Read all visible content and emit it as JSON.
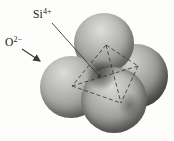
{
  "labels": {
    "si": {
      "base": "Si",
      "charge": "4+"
    },
    "o": {
      "base": "O",
      "charge": "2−"
    }
  },
  "colors": {
    "background": "#fdfdfc",
    "sphere_base": "#aaaaa8",
    "sphere_highlight": "#dededc",
    "sphere_rim_shadow": "#565654",
    "dashed_line": "#2f2f2f",
    "arrow": "#3a3a3a",
    "label_text": "#1a1a1a"
  }
}
